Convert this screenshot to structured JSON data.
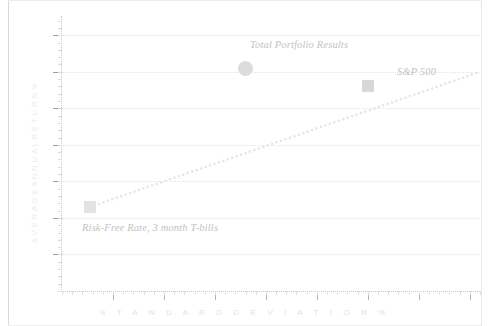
{
  "chart_data": {
    "type": "scatter",
    "title": "",
    "xlabel": "S T A N D A R D   D E V I A T I O N   %",
    "xlabel_text": "STANDARD DEVIATION %",
    "ylabel_text": "AVERAGE ANNUAL RETURN %",
    "grid": true,
    "legend_position": "none",
    "xlim": [
      0,
      8.2
    ],
    "ylim": [
      0,
      7.5
    ],
    "xticks": [
      1,
      2,
      3,
      4,
      5,
      6,
      7,
      8
    ],
    "yticks": [
      1,
      2,
      3,
      4,
      5,
      6,
      7
    ],
    "points": [
      {
        "label": "Total Portfolio Results",
        "x": 3.6,
        "y": 6.1,
        "marker": "circle",
        "marker_px": 15,
        "color": "#dcdcdc",
        "label_position": "above"
      },
      {
        "label": "S&P 500",
        "x": 6.0,
        "y": 5.6,
        "marker": "square",
        "marker_px": 12,
        "color": "#d8d8d8",
        "label_position": "above"
      },
      {
        "label": "Risk-Free Rate, 3 month T-bills",
        "x": 0.55,
        "y": 2.3,
        "marker": "square",
        "marker_px": 12,
        "color": "#e2e2e2",
        "label_position": "below"
      }
    ],
    "trendline": {
      "name": "Capital Market Line",
      "style": "dotted",
      "color": "#e6e6e6",
      "from": {
        "x": 0.55,
        "y": 2.3
      },
      "to": {
        "x": 8.2,
        "y": 6.0
      }
    }
  },
  "annotations": {
    "portfolio": "Total Portfolio Results",
    "sp500": "S&P 500",
    "riskfree": "Risk-Free Rate, 3 month T-bills"
  },
  "axes": {
    "x_title": "S T A N D A R D   D E V I A T I O N   %",
    "y_title": "A V E R A G E   A N N U A L   R E T U R N   %"
  },
  "colors": {
    "background": "#ffffff",
    "grid": "#e4e4e4",
    "axis": "#c9c9c9",
    "tick_major": "#9e9e9e",
    "marker": "#dcdcdc",
    "text": "#c2c2c2",
    "axis_title": "#e2e2e2"
  }
}
